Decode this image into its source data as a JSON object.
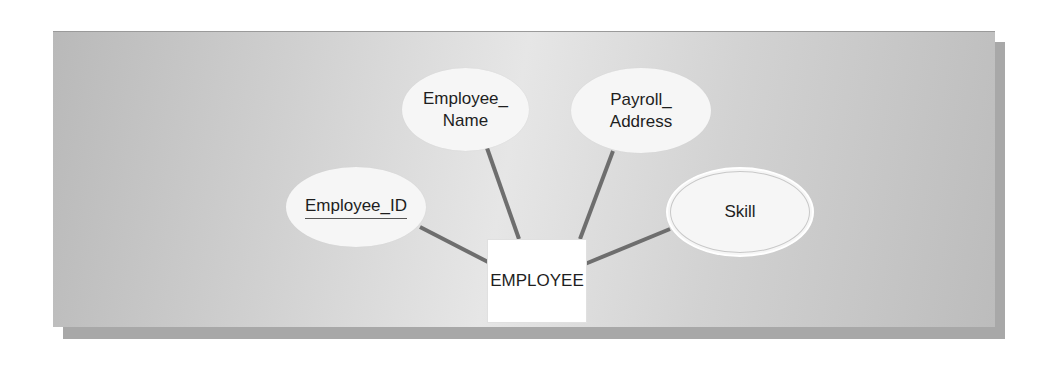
{
  "diagram": {
    "type": "ER diagram",
    "entity": {
      "label": "EMPLOYEE"
    },
    "attributes": [
      {
        "id": "employee_id",
        "label": "Employee_ID",
        "key": true,
        "multivalued": false
      },
      {
        "id": "employee_name",
        "label_line1": "Employee_",
        "label_line2": "Name",
        "key": false,
        "multivalued": false
      },
      {
        "id": "payroll_address",
        "label_line1": "Payroll_",
        "label_line2": "Address",
        "key": false,
        "multivalued": false
      },
      {
        "id": "skill",
        "label": "Skill",
        "key": false,
        "multivalued": true
      }
    ],
    "colors": {
      "background_panel": "#d0d0d0",
      "ellipse_fill": "#f6f6f6",
      "link_line": "#6e6e6e",
      "entity_fill": "#ffffff"
    }
  }
}
